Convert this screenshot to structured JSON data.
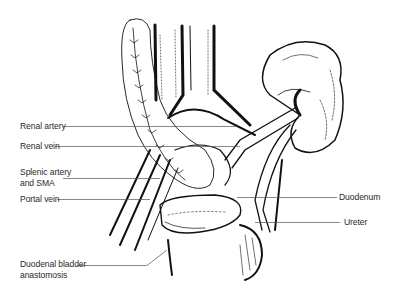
{
  "figure": {
    "labels": {
      "renal_artery": "Renal artery",
      "renal_vein": "Renal vein",
      "splenic_artery_line1": "Splenic artery",
      "splenic_artery_line2": "and SMA",
      "portal_vein": "Portal vein",
      "duodenal_line1": "Duodenal bladder",
      "duodenal_line2": "anastomosis",
      "duodenum": "Duodenum",
      "ureter": "Ureter"
    },
    "colors": {
      "ink": "#111111",
      "leader_line": "#555555",
      "text": "#2a2a2a",
      "background": "#ffffff"
    }
  }
}
